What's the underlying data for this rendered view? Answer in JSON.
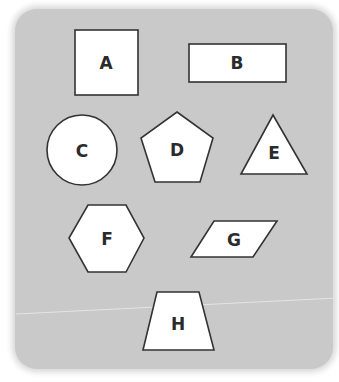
{
  "diagram": {
    "background_color": "#c9c9c9",
    "shapes": [
      {
        "id": "A",
        "label": "A",
        "type": "square"
      },
      {
        "id": "B",
        "label": "B",
        "type": "rectangle"
      },
      {
        "id": "C",
        "label": "C",
        "type": "circle"
      },
      {
        "id": "D",
        "label": "D",
        "type": "pentagon"
      },
      {
        "id": "E",
        "label": "E",
        "type": "triangle"
      },
      {
        "id": "F",
        "label": "F",
        "type": "hexagon"
      },
      {
        "id": "G",
        "label": "G",
        "type": "parallelogram"
      },
      {
        "id": "H",
        "label": "H",
        "type": "trapezoid"
      }
    ]
  }
}
